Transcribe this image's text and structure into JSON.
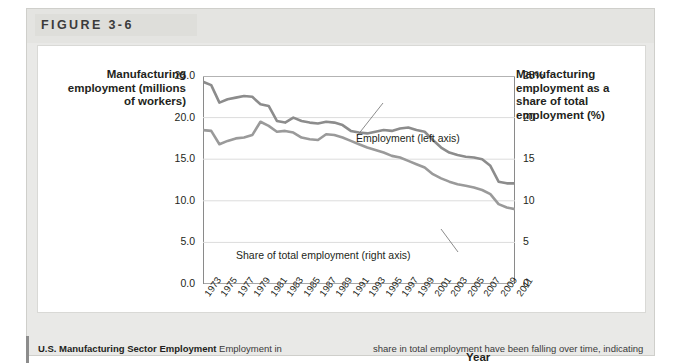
{
  "figure": {
    "number_label": "FIGURE 3-6"
  },
  "axis_titles": {
    "left": "Manufacturing employment (millions of workers)",
    "right": "Manufacturing employment as a share of total employment (%)",
    "x": "Year"
  },
  "annotations": {
    "employment": "Employment (left axis)",
    "share": "Share of total employment (right axis)"
  },
  "caption": {
    "title": "U.S. Manufacturing Sector Employment",
    "left_text": "Employment in",
    "right_text": "share in total employment have been falling over time, indicating"
  },
  "chart_data": {
    "type": "line",
    "title": "U.S. Manufacturing Sector Employment",
    "xlabel": "Year",
    "ylabel": "Manufacturing employment (millions of workers)",
    "y2label": "Manufacturing employment as a share of total employment (%)",
    "grid": true,
    "legend": "inline-annotations",
    "xlim": [
      1973,
      2011
    ],
    "ylim": [
      0.0,
      25.0
    ],
    "y2lim": [
      0,
      25
    ],
    "yticks": [
      "0.0",
      "5.0",
      "10.0",
      "15.0",
      "20.0",
      "25.0"
    ],
    "ytick_values": [
      0,
      5,
      10,
      15,
      20,
      25
    ],
    "y2ticks": [
      "0",
      "5",
      "10",
      "15",
      "20",
      "25%"
    ],
    "y2tick_values": [
      0,
      5,
      10,
      15,
      20,
      25
    ],
    "xticks": [
      "1973",
      "1975",
      "1977",
      "1979",
      "1981",
      "1983",
      "1985",
      "1987",
      "1989",
      "1991",
      "1993",
      "1995",
      "1997",
      "1999",
      "2001",
      "2003",
      "2005",
      "2007",
      "2009",
      "2011"
    ],
    "x": [
      1973,
      1974,
      1975,
      1976,
      1977,
      1978,
      1979,
      1980,
      1981,
      1982,
      1983,
      1984,
      1985,
      1986,
      1987,
      1988,
      1989,
      1990,
      1991,
      1992,
      1993,
      1994,
      1995,
      1996,
      1997,
      1998,
      1999,
      2000,
      2001,
      2002,
      2003,
      2004,
      2005,
      2006,
      2007,
      2008,
      2009,
      2010,
      2011
    ],
    "series": [
      {
        "name": "Employment (left axis)",
        "axis": "left",
        "unit": "millions of workers",
        "color": "#8c8c8c",
        "values": [
          24.3,
          23.9,
          21.8,
          22.2,
          22.4,
          22.6,
          22.5,
          21.6,
          21.4,
          19.6,
          19.4,
          20.0,
          19.6,
          19.4,
          19.3,
          19.5,
          19.4,
          19.1,
          18.4,
          18.2,
          18.1,
          18.3,
          18.5,
          18.4,
          18.7,
          18.8,
          18.5,
          18.3,
          17.3,
          16.4,
          15.8,
          15.5,
          15.3,
          15.2,
          15.0,
          14.2,
          12.3,
          12.1,
          12.1
        ]
      },
      {
        "name": "Share of total employment (right axis)",
        "axis": "right",
        "unit": "percent",
        "color": "#9a9a9a",
        "values": [
          18.5,
          18.4,
          16.8,
          17.2,
          17.5,
          17.6,
          17.9,
          19.5,
          19.0,
          18.3,
          18.4,
          18.2,
          17.6,
          17.4,
          17.3,
          18.0,
          17.9,
          17.6,
          17.2,
          16.8,
          16.4,
          16.1,
          15.8,
          15.4,
          15.2,
          14.8,
          14.4,
          14.0,
          13.2,
          12.7,
          12.3,
          12.0,
          11.8,
          11.6,
          11.3,
          10.8,
          9.6,
          9.2,
          9.0
        ]
      }
    ]
  }
}
